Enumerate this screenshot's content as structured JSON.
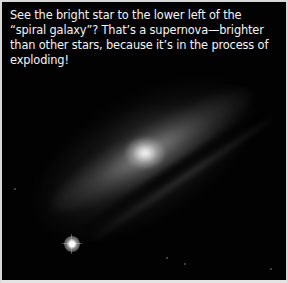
{
  "figure": {
    "caption": "See the bright star to the lower left of the “spiral galaxy”? That’s a supernova—brighter than other stars, because it’s in the process of exploding!",
    "colors": {
      "background": "#020202",
      "caption_text": "#f4f4f4",
      "frame_border": "#d8d8d8"
    }
  }
}
